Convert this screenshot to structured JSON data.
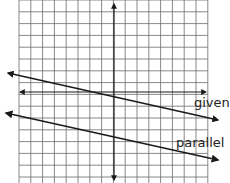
{
  "diagram": {
    "grid": {
      "x0": 19,
      "y0": 0,
      "cols": 16,
      "rows": 16,
      "cell": 11.8,
      "line_color": "#6a6a6a"
    },
    "axes": {
      "x_axis": {
        "x1": 20,
        "y": 92,
        "x2": 206
      },
      "y_axis": {
        "x": 114,
        "y1": 4,
        "y2": 180
      }
    },
    "lines": [
      {
        "name": "given",
        "label": "given",
        "x1": 8,
        "y1": 73,
        "x2": 218,
        "y2": 120,
        "label_x": 194,
        "label_y": 96
      },
      {
        "name": "parallel",
        "label": "parallel",
        "x1": 6,
        "y1": 113,
        "x2": 218,
        "y2": 160,
        "label_x": 176,
        "label_y": 136
      }
    ],
    "stroke_color": "#1a1a1a"
  }
}
